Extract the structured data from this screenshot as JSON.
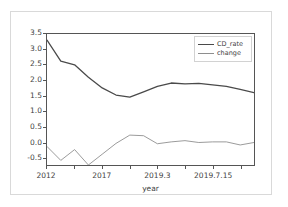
{
  "chart_data": {
    "type": "line",
    "title": "",
    "xlabel": "year",
    "ylabel": "",
    "grid": false,
    "legend_position": "upper right",
    "xlim": [
      0,
      15
    ],
    "ylim": [
      -0.75,
      3.5
    ],
    "yticks": [
      -0.5,
      0.0,
      0.5,
      1.0,
      1.5,
      2.0,
      2.5,
      3.0,
      3.5
    ],
    "ytick_labels": [
      "-0.5",
      "0.0",
      "0.5",
      "1.0",
      "1.5",
      "2.0",
      "2.5",
      "3.0",
      "3.5"
    ],
    "xticks": [
      0,
      2,
      4,
      6,
      8,
      10,
      12,
      14
    ],
    "xtick_labels": [
      "2012",
      "",
      "2017",
      "",
      "2019.3",
      "",
      "2019.7.15",
      ""
    ],
    "x": [
      0,
      1,
      2,
      3,
      4,
      5,
      6,
      7,
      8,
      9,
      10,
      11,
      12,
      13,
      14,
      15
    ],
    "series": [
      {
        "name": "CD_rate",
        "color": "#4a4a4a",
        "linewidth": 1.3,
        "values": [
          3.3,
          2.62,
          2.5,
          2.1,
          1.75,
          1.52,
          1.45,
          1.62,
          1.8,
          1.91,
          1.88,
          1.9,
          1.85,
          1.8,
          1.7,
          1.6
        ]
      },
      {
        "name": "change",
        "color": "#8e8e8e",
        "linewidth": 0.9,
        "values": [
          -0.15,
          -0.6,
          -0.25,
          -0.75,
          -0.4,
          -0.05,
          0.22,
          0.2,
          -0.06,
          0.0,
          0.04,
          -0.02,
          0.0,
          0.0,
          -0.1,
          -0.02
        ]
      }
    ]
  },
  "axes": {
    "spine_color": "#555555",
    "tick_color": "#555555",
    "label_color": "#3f3f3f"
  },
  "legend": {
    "entries": [
      {
        "label": "CD_rate"
      },
      {
        "label": "change"
      }
    ]
  },
  "figure": {
    "background": "#ffffff",
    "frame_color": "#d9d9d9"
  }
}
